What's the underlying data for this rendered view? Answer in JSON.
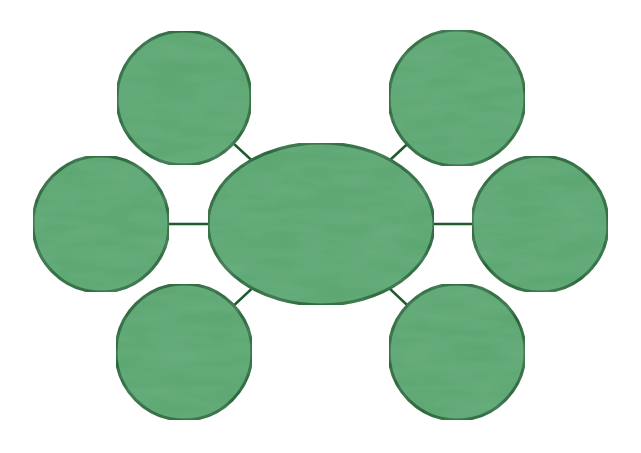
{
  "diagram": {
    "type": "bubble-map",
    "title": "",
    "colors": {
      "background": "#ffffff",
      "fill": "#5ba56f",
      "fill_shade": "#4f9b64",
      "stroke": "#1f5a2c"
    },
    "center": {
      "id": "center",
      "label": ""
    },
    "satellites": [
      {
        "id": "top-left",
        "label": ""
      },
      {
        "id": "top-right",
        "label": ""
      },
      {
        "id": "left",
        "label": ""
      },
      {
        "id": "right",
        "label": ""
      },
      {
        "id": "bottom-left",
        "label": ""
      },
      {
        "id": "bottom-right",
        "label": ""
      }
    ],
    "edges": [
      {
        "from": "center",
        "to": "top-left"
      },
      {
        "from": "center",
        "to": "top-right"
      },
      {
        "from": "center",
        "to": "left"
      },
      {
        "from": "center",
        "to": "right"
      },
      {
        "from": "center",
        "to": "bottom-left"
      },
      {
        "from": "center",
        "to": "bottom-right"
      }
    ]
  }
}
